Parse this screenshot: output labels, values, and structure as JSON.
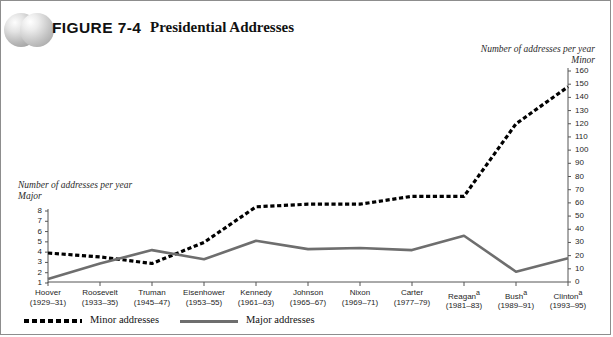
{
  "figure": {
    "label": "FIGURE 7-4",
    "title": "Presidential Addresses"
  },
  "captions": {
    "right_line1": "Number of addresses per year",
    "right_line2": "Minor",
    "left_line1": "Number of addresses per year",
    "left_line2": "Major"
  },
  "legend": {
    "minor_label": "Minor addresses",
    "major_label": "Major addresses"
  },
  "chart_data": {
    "type": "line",
    "title": "Presidential Addresses",
    "xlabel": "",
    "ylabel": "Number of addresses per year",
    "grid": false,
    "legend_position": "bottom",
    "categories": [
      "Hoover",
      "Roosevelt",
      "Truman",
      "Eisenhower",
      "Kennedy",
      "Johnson",
      "Nixon",
      "Carter",
      "Reagan*",
      "Bush*",
      "Clinton*"
    ],
    "category_years": [
      "(1929–31)",
      "(1933–35)",
      "(1945–47)",
      "(1953–55)",
      "(1961–63)",
      "(1965–67)",
      "(1969–71)",
      "(1977–79)",
      "(1981–83)",
      "(1989–91)",
      "(1993–95)"
    ],
    "axes": {
      "left": {
        "name": "Major",
        "ticks": [
          1,
          2,
          3,
          4,
          5,
          6,
          7,
          8
        ],
        "ylim": [
          1,
          8
        ]
      },
      "right": {
        "name": "Minor",
        "ticks": [
          0,
          10,
          20,
          30,
          40,
          50,
          60,
          70,
          80,
          90,
          100,
          110,
          120,
          130,
          140,
          150,
          160
        ],
        "ylim": [
          0,
          160
        ]
      }
    },
    "series": [
      {
        "name": "Minor addresses",
        "axis": "right",
        "style": "dotted",
        "color": "#000000",
        "values": [
          22,
          19,
          14,
          30,
          57,
          59,
          59,
          65,
          65,
          120,
          148
        ]
      },
      {
        "name": "Major addresses",
        "axis": "left",
        "style": "solid",
        "color": "#6e6e6e",
        "values": [
          1.4,
          2.9,
          4.2,
          3.3,
          5.1,
          4.3,
          4.4,
          4.2,
          5.6,
          2.1,
          3.4
        ]
      }
    ]
  }
}
